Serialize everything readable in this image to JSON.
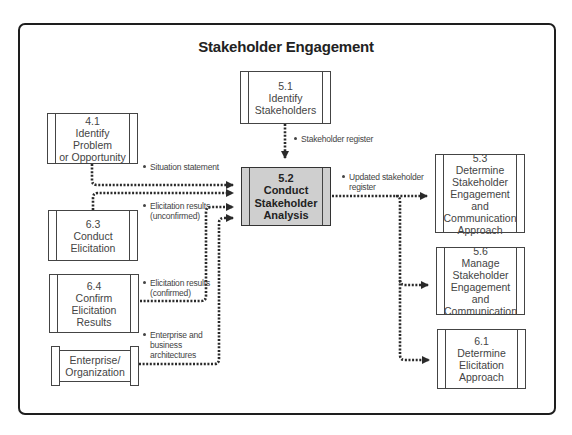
{
  "diagram": {
    "title": "Stakeholder Engagement",
    "colors": {
      "frame": "#1e1e1e",
      "box_border": "#444444",
      "main_fill": "#cfcfcf",
      "connector": "#2a2a2a"
    },
    "boxes": {
      "b51": {
        "num": "5.1",
        "lines": [
          "Identify",
          "Stakeholders"
        ]
      },
      "b41": {
        "num": "4.1",
        "lines": [
          "Identify Problem",
          "or Opportunity"
        ]
      },
      "b63": {
        "num": "6.3",
        "lines": [
          "Conduct",
          "Elicitation"
        ]
      },
      "b64": {
        "num": "6.4",
        "lines": [
          "Confirm",
          "Elicitation",
          "Results"
        ]
      },
      "ent": {
        "num": "",
        "lines": [
          "Enterprise/",
          "Organization"
        ]
      },
      "b52": {
        "num": "5.2",
        "lines": [
          "Conduct",
          "Stakeholder",
          "Analysis"
        ]
      },
      "b53": {
        "num": "5.3",
        "lines": [
          "Determine",
          "Stakeholder",
          "Engagement and",
          "Communication",
          "Approach"
        ]
      },
      "b56": {
        "num": "5.6",
        "lines": [
          "Manage",
          "Stakeholder",
          "Engagement and",
          "Communication"
        ]
      },
      "b61": {
        "num": "6.1",
        "lines": [
          "Determine",
          "Elicitation",
          "Approach"
        ]
      }
    },
    "labels": {
      "stakeholder_register": [
        "Stakeholder register"
      ],
      "situation_statement": [
        "Situation statement"
      ],
      "elicitation_unconfirmed": [
        "Elicitation results",
        "(unconfirmed)"
      ],
      "elicitation_confirmed": [
        "Elicitation results",
        "(confirmed)"
      ],
      "enterprise_arch": [
        "Enterprise and",
        "business",
        "architectures"
      ],
      "updated_register": [
        "Updated stakeholder",
        "register"
      ]
    }
  }
}
